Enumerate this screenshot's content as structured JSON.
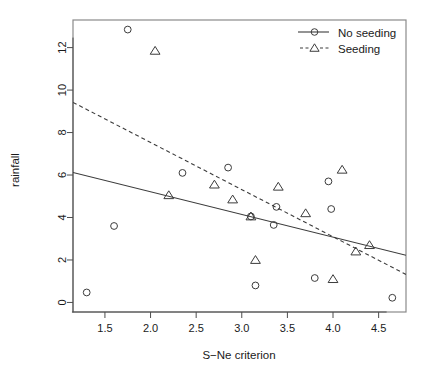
{
  "chart_data": {
    "type": "scatter",
    "title": "",
    "xlabel": "S−Ne criterion",
    "ylabel": "rainfall",
    "xlim": [
      1.15,
      4.8
    ],
    "ylim": [
      -0.45,
      13.3
    ],
    "xticks": [
      "1.5",
      "2.0",
      "2.5",
      "3.0",
      "3.5",
      "4.0",
      "4.5"
    ],
    "xtick_values": [
      1.5,
      2.0,
      2.5,
      3.0,
      3.5,
      4.0,
      4.5
    ],
    "yticks": [
      "0",
      "2",
      "4",
      "6",
      "8",
      "10",
      "12"
    ],
    "ytick_values": [
      0,
      2,
      4,
      6,
      8,
      10,
      12
    ],
    "grid": false,
    "legend_position": "top-right",
    "series": [
      {
        "name": "No seeding",
        "marker": "circle",
        "line_style": "solid",
        "color": "#3c3c3c",
        "points": [
          {
            "x": 1.3,
            "y": 0.47
          },
          {
            "x": 1.6,
            "y": 3.6
          },
          {
            "x": 1.75,
            "y": 12.85
          },
          {
            "x": 2.35,
            "y": 6.1
          },
          {
            "x": 2.85,
            "y": 6.35
          },
          {
            "x": 3.1,
            "y": 4.05
          },
          {
            "x": 3.15,
            "y": 0.8
          },
          {
            "x": 3.35,
            "y": 3.65
          },
          {
            "x": 3.38,
            "y": 4.5
          },
          {
            "x": 3.8,
            "y": 1.15
          },
          {
            "x": 3.95,
            "y": 5.7
          },
          {
            "x": 3.98,
            "y": 4.4
          },
          {
            "x": 4.65,
            "y": 0.22
          }
        ],
        "fit_line": {
          "x1": 1.15,
          "y1": 6.12,
          "x2": 4.8,
          "y2": 2.22
        }
      },
      {
        "name": "Seeding",
        "marker": "triangle",
        "line_style": "dashed",
        "color": "#3c3c3c",
        "points": [
          {
            "x": 2.05,
            "y": 11.85
          },
          {
            "x": 2.2,
            "y": 5.05
          },
          {
            "x": 2.7,
            "y": 5.55
          },
          {
            "x": 2.9,
            "y": 4.85
          },
          {
            "x": 3.1,
            "y": 4.05
          },
          {
            "x": 3.15,
            "y": 2.0
          },
          {
            "x": 3.4,
            "y": 5.45
          },
          {
            "x": 3.7,
            "y": 4.2
          },
          {
            "x": 4.0,
            "y": 1.1
          },
          {
            "x": 4.1,
            "y": 6.25
          },
          {
            "x": 4.25,
            "y": 2.4
          },
          {
            "x": 4.4,
            "y": 2.7
          }
        ],
        "fit_line": {
          "x1": 1.15,
          "y1": 9.42,
          "x2": 4.8,
          "y2": 1.32
        }
      }
    ],
    "legend": [
      {
        "label": "No seeding",
        "marker": "circle",
        "line_style": "solid"
      },
      {
        "label": "Seeding",
        "marker": "triangle",
        "line_style": "dashed"
      }
    ]
  }
}
